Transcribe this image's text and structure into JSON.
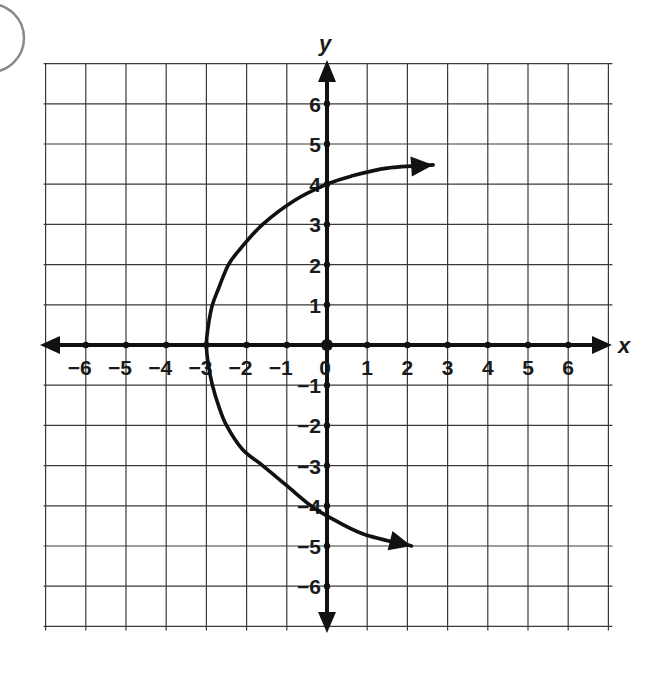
{
  "question_bubble": {
    "visible": true
  },
  "chart_data": {
    "type": "line",
    "title": "",
    "xlabel": "x",
    "ylabel": "y",
    "xlim": [
      -7,
      7
    ],
    "ylim": [
      -7,
      7
    ],
    "grid": true,
    "x_ticks": [
      -6,
      -5,
      -4,
      -3,
      -2,
      -1,
      1,
      2,
      3,
      4,
      5,
      6
    ],
    "y_ticks": [
      -6,
      -5,
      -4,
      -3,
      -2,
      -1,
      1,
      2,
      3,
      4,
      5,
      6
    ],
    "x_tick_labels": [
      "-6",
      "-5",
      "-4",
      "-3",
      "-2",
      "-1",
      "1",
      "2",
      "3",
      "4",
      "5",
      "6"
    ],
    "y_tick_labels": [
      "-6",
      "-5",
      "-4",
      "-3",
      "-2",
      "-1",
      "1",
      "2",
      "3",
      "4",
      "5",
      "6"
    ],
    "origin_label": "0",
    "series": [
      {
        "name": "curve",
        "description": "Sideways curve opening right with vertex at (-3, 0), arrows at both ends",
        "points": [
          [
            2.64,
            4.48
          ],
          [
            1.5,
            4.4
          ],
          [
            0.6,
            4.2
          ],
          [
            0,
            4.0
          ],
          [
            -0.8,
            3.6
          ],
          [
            -1.6,
            3.0
          ],
          [
            -2.15,
            2.4
          ],
          [
            -2.45,
            2.0
          ],
          [
            -2.7,
            1.4
          ],
          [
            -2.85,
            1.0
          ],
          [
            -2.95,
            0.5
          ],
          [
            -3,
            0
          ],
          [
            -2.95,
            -0.5
          ],
          [
            -2.85,
            -1.0
          ],
          [
            -2.7,
            -1.5
          ],
          [
            -2.5,
            -2.0
          ],
          [
            -2.1,
            -2.6
          ],
          [
            -1.6,
            -3.0
          ],
          [
            -1.0,
            -3.5
          ],
          [
            -0.4,
            -4.0
          ],
          [
            0,
            -4.25
          ],
          [
            0.9,
            -4.7
          ],
          [
            2.1,
            -5.0
          ]
        ],
        "key_points": {
          "vertex": [
            -3,
            0
          ],
          "y_intercepts": [
            4,
            -4.25
          ]
        },
        "arrows": [
          "start",
          "end"
        ]
      }
    ]
  }
}
